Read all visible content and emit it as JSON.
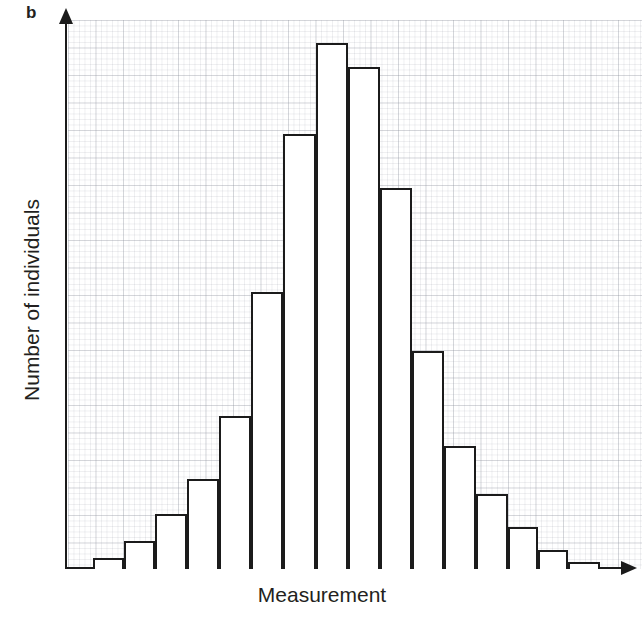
{
  "figure": {
    "panel_label": "b",
    "background_color": "#ffffff",
    "grid_color": "#969baa",
    "ink_color": "#1b1b1b"
  },
  "chart_data": {
    "type": "bar",
    "title": "",
    "subtitle": "",
    "xlabel": "Measurement",
    "ylabel": "Number of individuals",
    "panel": "b",
    "grid": true,
    "legend": null,
    "xticklabels": [],
    "yticklabels": [],
    "axis_style": "arrow-axes, no tick marks, no tick labels",
    "categories": [
      "1",
      "2",
      "3",
      "4",
      "5",
      "6",
      "7",
      "8",
      "9",
      "10",
      "11",
      "12",
      "13",
      "14",
      "15",
      "16"
    ],
    "values": [
      2,
      5,
      10,
      17,
      29,
      53,
      83,
      100,
      95,
      72,
      41,
      23,
      14,
      8,
      3,
      1
    ],
    "ylim": [
      0,
      107
    ],
    "xlim": [
      0,
      16
    ],
    "bar_edge_color": "#1b1b1b",
    "bar_fill_color": "#ffffff",
    "bars": [
      {
        "index": 1,
        "label": "1",
        "value": 2,
        "x": 93,
        "width": 31,
        "top": 558
      },
      {
        "index": 2,
        "label": "2",
        "value": 5,
        "x": 124,
        "width": 31,
        "top": 541
      },
      {
        "index": 3,
        "label": "3",
        "value": 10,
        "x": 155,
        "width": 32,
        "top": 514
      },
      {
        "index": 4,
        "label": "4",
        "value": 17,
        "x": 187,
        "width": 32,
        "top": 479
      },
      {
        "index": 5,
        "label": "5",
        "value": 29,
        "x": 219,
        "width": 32,
        "top": 416
      },
      {
        "index": 6,
        "label": "6",
        "value": 53,
        "x": 251,
        "width": 32,
        "top": 292
      },
      {
        "index": 7,
        "label": "7",
        "value": 83,
        "x": 283,
        "width": 33,
        "top": 134
      },
      {
        "index": 8,
        "label": "8",
        "value": 100,
        "x": 316,
        "width": 32,
        "top": 43
      },
      {
        "index": 9,
        "label": "9",
        "value": 95,
        "x": 348,
        "width": 32,
        "top": 67
      },
      {
        "index": 10,
        "label": "10",
        "value": 72,
        "x": 380,
        "width": 32,
        "top": 188
      },
      {
        "index": 11,
        "label": "11",
        "value": 41,
        "x": 412,
        "width": 32,
        "top": 351
      },
      {
        "index": 12,
        "label": "12",
        "value": 23,
        "x": 444,
        "width": 32,
        "top": 446
      },
      {
        "index": 13,
        "label": "13",
        "value": 14,
        "x": 476,
        "width": 32,
        "top": 494
      },
      {
        "index": 14,
        "label": "14",
        "value": 8,
        "x": 508,
        "width": 30,
        "top": 527
      },
      {
        "index": 15,
        "label": "15",
        "value": 3,
        "x": 538,
        "width": 30,
        "top": 550
      },
      {
        "index": 16,
        "label": "16",
        "value": 1,
        "x": 568,
        "width": 32,
        "top": 562
      }
    ]
  }
}
